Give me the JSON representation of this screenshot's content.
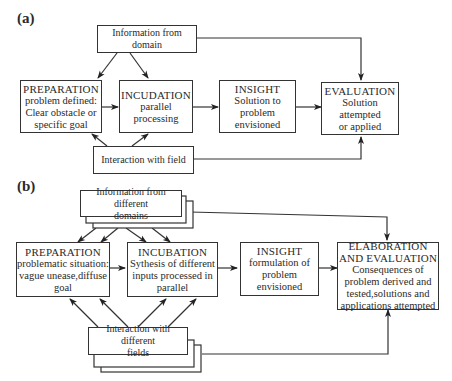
{
  "panel_a": {
    "label": "(a)",
    "info_box": "Information from domain",
    "preparation": {
      "title": "PREPARATION",
      "lines": [
        "problem defined:",
        "Clear obstacle or",
        "specific goal"
      ]
    },
    "incubation": {
      "title": "INCUDATION",
      "lines": [
        "parallel processing"
      ]
    },
    "insight": {
      "title": "INSIGHT",
      "lines": [
        "Solution to",
        "problem",
        "envisioned"
      ]
    },
    "evaluation": {
      "title": "EVALUATION",
      "lines": [
        "Solution attempted",
        "or applied"
      ]
    },
    "interaction_box": "Interaction with field"
  },
  "panel_b": {
    "label": "(b)",
    "info_box": [
      "Information from different",
      "domains"
    ],
    "preparation": {
      "title": "PREPARATION",
      "lines": [
        "problematic situation:",
        "vague unease,diffuse",
        "goal"
      ]
    },
    "incubation": {
      "title": "INCUBATION",
      "lines": [
        "Sythesis of different",
        "inputs processed in",
        "parallel"
      ]
    },
    "insight": {
      "title": "INSIGHT",
      "lines": [
        "formulation of",
        "problem",
        "envisioned"
      ]
    },
    "evaluation": {
      "title_lines": [
        "ELABORATION",
        "AND EVALUATION"
      ],
      "lines": [
        "Consequences of",
        "problem derived and",
        "tested,solutions and",
        "applications attempted"
      ]
    },
    "interaction_box": [
      "Interaction with different",
      "fields"
    ]
  },
  "colors": {
    "stroke": "#333333",
    "text": "#2a2a2a",
    "background": "#ffffff"
  }
}
